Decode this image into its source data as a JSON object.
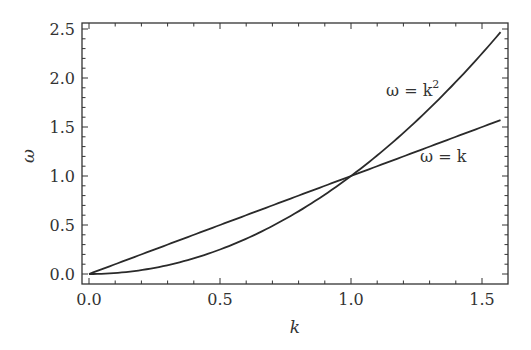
{
  "chart_data": {
    "type": "line",
    "title": "",
    "xlabel": "k",
    "ylabel": "ω",
    "xlim": [
      0,
      1.5708
    ],
    "ylim": [
      0,
      2.5
    ],
    "xticks": [
      "0.0",
      "0.5",
      "1.0",
      "1.5"
    ],
    "yticks": [
      "0.0",
      "0.5",
      "1.0",
      "1.5",
      "2.0",
      "2.5"
    ],
    "grid": false,
    "legend": "none (inline curve labels)",
    "series": [
      {
        "name": "ω = k",
        "label_main": "ω = k",
        "x": [
          0,
          0.25,
          0.5,
          0.75,
          1.0,
          1.25,
          1.5708
        ],
        "y": [
          0,
          0.25,
          0.5,
          0.75,
          1.0,
          1.25,
          1.5708
        ]
      },
      {
        "name": "ω = k²",
        "label_main": "ω = k",
        "label_sup": "2",
        "x": [
          0,
          0.25,
          0.5,
          0.75,
          1.0,
          1.25,
          1.5708
        ],
        "y": [
          0,
          0.0625,
          0.25,
          0.5625,
          1.0,
          1.5625,
          2.4674
        ]
      }
    ],
    "annotations": [
      {
        "text": "ω = k²",
        "x": 1.25,
        "y": 2.0
      },
      {
        "text": "ω = k",
        "x": 1.35,
        "y": 1.1
      }
    ]
  }
}
